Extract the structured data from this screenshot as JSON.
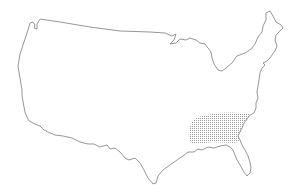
{
  "map": {
    "subject": "Continental United States outline",
    "background_color": "#ffffff",
    "outline_color": "#8a8a8a",
    "highlighted_region": {
      "label": "Southeastern United States",
      "fill_pattern": "stipple-dots",
      "dot_color": "#9a9a9a"
    }
  }
}
